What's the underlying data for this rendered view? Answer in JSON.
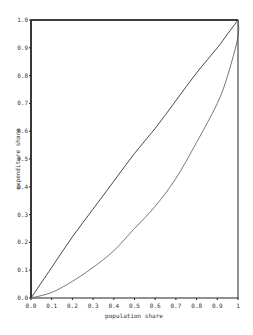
{
  "chart_data": {
    "type": "line",
    "title": "",
    "xlabel": "population share",
    "ylabel": "expenditure share",
    "xlim": [
      0,
      1
    ],
    "ylim": [
      0,
      1
    ],
    "grid": false,
    "legend": null,
    "x_ticks": [
      "0.0",
      "0.1",
      "0.2",
      "0.3",
      "0.4",
      "0.5",
      "0.6",
      "0.7",
      "0.8",
      "0.9",
      "1"
    ],
    "y_ticks": [
      "0.0",
      "0.1",
      "0.2",
      "0.3",
      "0.4",
      "0.5",
      "0.6",
      "0.7",
      "0.8",
      "0.9",
      "1.0"
    ],
    "x": [
      0,
      0.1,
      0.2,
      0.3,
      0.4,
      0.5,
      0.6,
      0.7,
      0.8,
      0.9,
      0.95,
      1.0
    ],
    "series": [
      {
        "name": "upper curve",
        "values": [
          0,
          0.11,
          0.22,
          0.32,
          0.42,
          0.52,
          0.61,
          0.71,
          0.81,
          0.9,
          0.95,
          1.0
        ]
      },
      {
        "name": "lower curve",
        "values": [
          0,
          0.02,
          0.06,
          0.11,
          0.17,
          0.25,
          0.33,
          0.43,
          0.56,
          0.7,
          0.8,
          0.94
        ]
      }
    ]
  }
}
